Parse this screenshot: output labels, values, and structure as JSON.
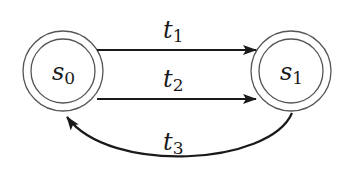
{
  "diagram": {
    "type": "state-transition-graph",
    "states": [
      {
        "id": "s0",
        "name": "s",
        "subscript": "0"
      },
      {
        "id": "s1",
        "name": "s",
        "subscript": "1"
      }
    ],
    "transitions": [
      {
        "id": "t1",
        "name": "t",
        "subscript": "1",
        "from": "s0",
        "to": "s1"
      },
      {
        "id": "t2",
        "name": "t",
        "subscript": "2",
        "from": "s0",
        "to": "s1"
      },
      {
        "id": "t3",
        "name": "t",
        "subscript": "3",
        "from": "s1",
        "to": "s0"
      }
    ],
    "colors": {
      "stroke": "#1a1a1a",
      "background": "#ffffff"
    }
  }
}
